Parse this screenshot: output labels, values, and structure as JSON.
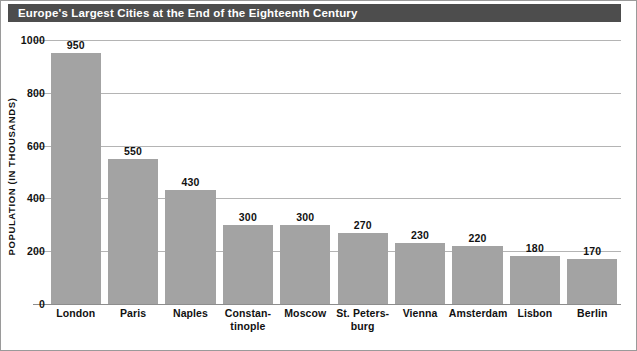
{
  "title": "Europe's Largest Cities at the End of the Eighteenth Century",
  "colors": {
    "title_bar": "#4d4d4d",
    "title_text": "#ffffff",
    "bar_fill": "#a3a3a3",
    "gridline": "#b4b4b4",
    "axis": "#8d8d8d",
    "text": "#111111",
    "background": "#ffffff"
  },
  "chart_data": {
    "type": "bar",
    "title": "Europe's Largest Cities at the End of the Eighteenth Century",
    "xlabel": "",
    "ylabel": "POPULATION (IN THOUSANDS)",
    "ylim": [
      0,
      1000
    ],
    "yticks": [
      0,
      200,
      400,
      600,
      800,
      1000
    ],
    "ytick_labels": [
      "0",
      "200",
      "400",
      "600",
      "800",
      "1000"
    ],
    "grid": true,
    "legend": false,
    "categories": [
      "London",
      "Paris",
      "Naples",
      "Constan-tinople",
      "Moscow",
      "St. Peters-burg",
      "Vienna",
      "Amsterdam",
      "Lisbon",
      "Berlin"
    ],
    "category_lines": [
      [
        "London"
      ],
      [
        "Paris"
      ],
      [
        "Naples"
      ],
      [
        "Constan-",
        "tinople"
      ],
      [
        "Moscow"
      ],
      [
        "St. Peters-",
        "burg"
      ],
      [
        "Vienna"
      ],
      [
        "Amsterdam"
      ],
      [
        "Lisbon"
      ],
      [
        "Berlin"
      ]
    ],
    "values": [
      950,
      550,
      430,
      300,
      300,
      270,
      230,
      220,
      180,
      170
    ],
    "value_labels": [
      "950",
      "550",
      "430",
      "300",
      "300",
      "270",
      "230",
      "220",
      "180",
      "170"
    ]
  }
}
